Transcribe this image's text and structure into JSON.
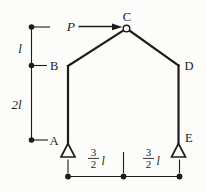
{
  "colors": {
    "background": "#fcfcfa",
    "ink": "#1d1c1a"
  },
  "diagram": {
    "load": {
      "label": "P"
    },
    "nodes": {
      "A": "A",
      "B": "B",
      "C": "C",
      "D": "D",
      "E": "E"
    },
    "dimensions": {
      "left_upper": {
        "label": "l"
      },
      "left_lower": {
        "label": "2l"
      },
      "bottom_left": {
        "numerator": "3",
        "denominator": "2",
        "unit": "l"
      },
      "bottom_right": {
        "numerator": "3",
        "denominator": "2",
        "unit": "l"
      }
    }
  }
}
